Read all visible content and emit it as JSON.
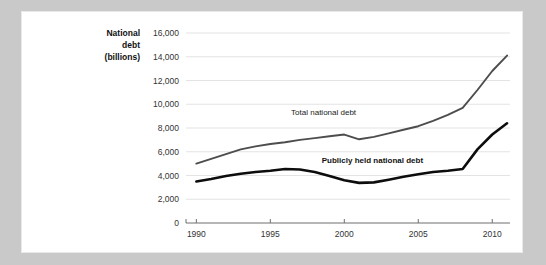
{
  "chart_data": {
    "type": "line",
    "title": "",
    "xlabel": "",
    "ylabel": "National debt (billions)",
    "ylabel_lines": [
      "National",
      "debt",
      "(billions)"
    ],
    "xlim": [
      1989.3,
      2011.2
    ],
    "ylim": [
      0,
      16000
    ],
    "grid": true,
    "legend_position": "inline-annotations",
    "ytick_labels": [
      "0",
      "2,000",
      "4,000",
      "6,000",
      "8,000",
      "10,000",
      "12,000",
      "14,000",
      "16,000"
    ],
    "ytick_values": [
      0,
      2000,
      4000,
      6000,
      8000,
      10000,
      12000,
      14000,
      16000
    ],
    "xtick_labels": [
      "1990",
      "1995",
      "2000",
      "2005",
      "2010"
    ],
    "xtick_values": [
      1990,
      1995,
      2000,
      2005,
      2010
    ],
    "series": [
      {
        "name": "Total national debt",
        "color": "#4d4d4d",
        "x": [
          1990,
          1991,
          1992,
          1993,
          1994,
          1995,
          1996,
          1997,
          1998,
          1999,
          2000,
          2001,
          2002,
          2003,
          2004,
          2005,
          2006,
          2007,
          2008,
          2009,
          2010,
          2011
        ],
        "values": [
          5000,
          5400,
          5800,
          6200,
          6450,
          6650,
          6800,
          7000,
          7150,
          7300,
          7450,
          7050,
          7250,
          7550,
          7850,
          8150,
          8600,
          9100,
          9700,
          11200,
          12800,
          14100
        ],
        "label_text": "Total national debt",
        "label_x": 1998.6,
        "label_y": 9100
      },
      {
        "name": "Publicly held national debt",
        "color": "#0d0d0d",
        "x": [
          1990,
          1991,
          1992,
          1993,
          1994,
          1995,
          1996,
          1997,
          1998,
          1999,
          2000,
          2001,
          2002,
          2003,
          2004,
          2005,
          2006,
          2007,
          2008,
          2009,
          2010,
          2011
        ],
        "values": [
          3500,
          3700,
          3950,
          4150,
          4300,
          4400,
          4550,
          4500,
          4300,
          3950,
          3600,
          3380,
          3420,
          3650,
          3900,
          4100,
          4300,
          4400,
          4550,
          6200,
          7450,
          8400
        ],
        "label_text": "Publicly held national debt",
        "label_x": 2001.9,
        "label_y": 5050
      }
    ]
  }
}
